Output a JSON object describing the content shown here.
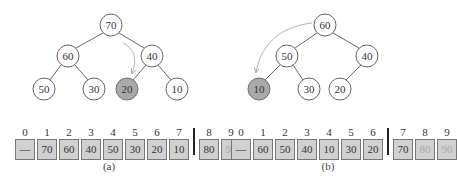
{
  "figure_a": {
    "caption": "(a)",
    "tree": {
      "nodes": [
        {
          "value": "70",
          "x": 111,
          "y": 25,
          "highlight": false
        },
        {
          "value": "60",
          "x": 68,
          "y": 56,
          "highlight": false
        },
        {
          "value": "40",
          "x": 152,
          "y": 56,
          "highlight": false
        },
        {
          "value": "50",
          "x": 44,
          "y": 89,
          "highlight": false
        },
        {
          "value": "30",
          "x": 94,
          "y": 89,
          "highlight": false
        },
        {
          "value": "20",
          "x": 127,
          "y": 89,
          "highlight": true
        },
        {
          "value": "10",
          "x": 177,
          "y": 89,
          "highlight": false
        }
      ]
    },
    "array": {
      "indices": [
        "0",
        "1",
        "2",
        "3",
        "4",
        "5",
        "6",
        "7",
        "8",
        "9"
      ],
      "values": [
        "—",
        "70",
        "60",
        "40",
        "50",
        "30",
        "20",
        "10",
        "80",
        "90"
      ],
      "divider_after_index": 7
    }
  },
  "figure_b": {
    "caption": "(b)",
    "tree": {
      "nodes": [
        {
          "value": "60",
          "x": 325,
          "y": 25,
          "highlight": false
        },
        {
          "value": "50",
          "x": 287,
          "y": 56,
          "highlight": false
        },
        {
          "value": "40",
          "x": 367,
          "y": 56,
          "highlight": false
        },
        {
          "value": "10",
          "x": 259,
          "y": 89,
          "highlight": true
        },
        {
          "value": "30",
          "x": 309,
          "y": 89,
          "highlight": false
        },
        {
          "value": "20",
          "x": 340,
          "y": 89,
          "highlight": false
        }
      ]
    },
    "array": {
      "indices": [
        "0",
        "1",
        "2",
        "3",
        "4",
        "5",
        "6",
        "7",
        "8",
        "9"
      ],
      "values": [
        "—",
        "60",
        "50",
        "40",
        "10",
        "30",
        "20",
        "70",
        "80",
        "90"
      ],
      "divider_after_index": 6
    }
  }
}
